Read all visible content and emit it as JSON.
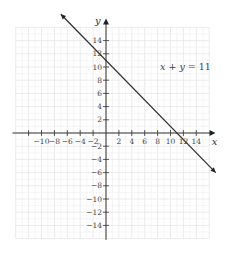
{
  "chart_data": {
    "type": "line",
    "title": "",
    "xlabel": "x",
    "ylabel": "y",
    "xlim": [
      -14,
      16
    ],
    "ylim": [
      -16,
      16
    ],
    "grid": true,
    "x_ticks": [
      -10,
      -8,
      -6,
      -4,
      -2,
      2,
      4,
      6,
      8,
      10,
      12,
      14
    ],
    "x_tick_labels": [
      "−10",
      "−8",
      "−6",
      "−4",
      "−2",
      "2",
      "4",
      "6",
      "8",
      "10",
      "12",
      "14"
    ],
    "y_ticks": [
      14,
      12,
      10,
      8,
      6,
      4,
      2,
      -2,
      -4,
      -6,
      -8,
      -10,
      -12,
      -14
    ],
    "y_tick_labels": [
      "14",
      "12",
      "10",
      "8",
      "6",
      "4",
      "2",
      "−2",
      "−4",
      "−6",
      "−8",
      "−10",
      "−12",
      "−14"
    ],
    "series": [
      {
        "name": "x + y = 11",
        "x": [
          -7,
          17
        ],
        "y": [
          18,
          -6
        ],
        "arrows": "both"
      }
    ],
    "annotations": [
      {
        "text": "x + y = 11",
        "x": 9,
        "y": 9.5
      }
    ]
  },
  "graph": {
    "equation_label": "x + y = 11",
    "x_axis_label": "x",
    "y_axis_label": "y"
  }
}
